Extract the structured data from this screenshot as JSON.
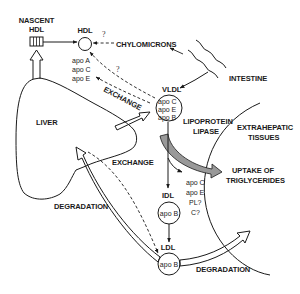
{
  "diagram": {
    "nodes": {
      "nascent_hdl": {
        "line1": "NASCENT",
        "line2": "HDL"
      },
      "hdl": {
        "label": "HDL",
        "apos": [
          "apo A",
          "apo C",
          "apo E"
        ]
      },
      "chylomicrons": {
        "label": "CHYLOMICRONS"
      },
      "intestine": {
        "label": "INTESTINE"
      },
      "vldl": {
        "label": "VLDL",
        "apos": [
          "apo C",
          "apo E",
          "apo B"
        ],
        "apo_prefix": "apo",
        "apo_letters": [
          "C",
          "E",
          "B"
        ]
      },
      "liver": {
        "label": "LIVER"
      },
      "lipoprotein_lipase": {
        "line1": "LIPOPROTEIN",
        "line2": "LIPASE"
      },
      "extrahepatic": {
        "line1": "EXTRAHEPATIC",
        "line2": "TISSUES"
      },
      "uptake": {
        "line1": "UPTAKE OF",
        "line2": "TRIGLYCERIDES"
      },
      "released": {
        "items": [
          "apo C",
          "apo E",
          "PL?",
          "C?"
        ]
      },
      "idl": {
        "label": "IDL",
        "apo": "apo B"
      },
      "ldl": {
        "label": "LDL",
        "apo": "apo B"
      }
    },
    "edge_labels": {
      "exchange_upper": "EXCHANGE",
      "exchange_lower": "EXCHANGE",
      "degradation_left": "DEGRADATION",
      "degradation_right": "DEGRADATION",
      "question": "?"
    }
  }
}
